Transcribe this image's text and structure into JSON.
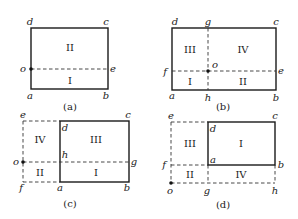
{
  "figure": {
    "panels": [
      {
        "id": "a",
        "caption": "(a)",
        "points": {
          "a": "a",
          "b": "b",
          "c": "c",
          "d": "d",
          "e": "e",
          "o": "o"
        },
        "regions": [
          "II",
          "I"
        ]
      },
      {
        "id": "b",
        "caption": "(b)",
        "points": {
          "a": "a",
          "b": "b",
          "c": "c",
          "d": "d",
          "e": "e",
          "f": "f",
          "g": "g",
          "h": "h",
          "o": "o"
        },
        "regions": [
          "III",
          "IV",
          "I",
          "II"
        ]
      },
      {
        "id": "c",
        "caption": "(c)",
        "points": {
          "a": "a",
          "b": "b",
          "c": "c",
          "d": "d",
          "e": "e",
          "f": "f",
          "g": "g",
          "h": "h",
          "o": "o"
        },
        "regions": [
          "IV",
          "III",
          "II",
          "I"
        ]
      },
      {
        "id": "d",
        "caption": "(d)",
        "points": {
          "a": "a",
          "b": "b",
          "c": "c",
          "d": "d",
          "e": "e",
          "f": "f",
          "g": "g",
          "h": "h",
          "o": "o"
        },
        "regions": [
          "III",
          "I",
          "II",
          "IV"
        ]
      }
    ]
  }
}
